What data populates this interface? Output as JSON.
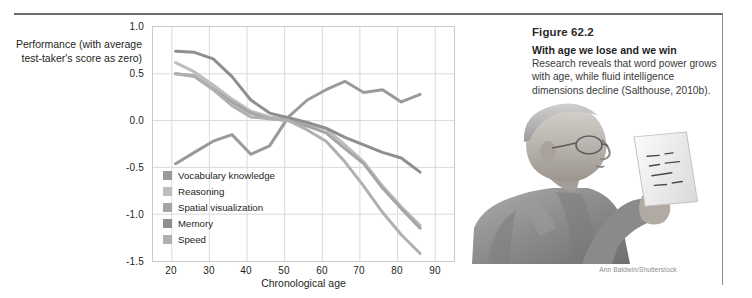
{
  "figure": {
    "caption_number": "Figure 62.2",
    "caption_lead": "With age we lose and we win",
    "caption_body": "Research reveals that word power grows with age, while fluid intelligence dimensions decline (Salthouse, 2010b).",
    "photo_credit": "Ann Baldwin/Shutterstock",
    "photo_alt": "older-man-reading-photo"
  },
  "chart_data": {
    "type": "line",
    "title": "",
    "xlabel": "Chronological age",
    "ylabel": "Performance (with average test-taker's score as zero)",
    "xlim": [
      15,
      95
    ],
    "ylim": [
      -1.5,
      1.0
    ],
    "xticks": [
      "20",
      "30",
      "40",
      "50",
      "60",
      "70",
      "80",
      "90"
    ],
    "xtick_values": [
      20,
      30,
      40,
      50,
      60,
      70,
      80,
      90
    ],
    "yticks": [
      "1.0",
      "0.5",
      "0.0",
      "-0.5",
      "-1.0",
      "-1.5"
    ],
    "ytick_values": [
      1.0,
      0.5,
      0.0,
      -0.5,
      -1.0,
      -1.5
    ],
    "grid": true,
    "legend_position": "inside-lower-left",
    "series": [
      {
        "name": "Vocabulary knowledge",
        "color": "#9a9a9a",
        "x": [
          21,
          26,
          31,
          36,
          41,
          46,
          51,
          56,
          61,
          66,
          71,
          76,
          81,
          86
        ],
        "y": [
          -0.46,
          -0.34,
          -0.22,
          -0.15,
          -0.36,
          -0.27,
          0.04,
          0.22,
          0.33,
          0.42,
          0.3,
          0.33,
          0.2,
          0.28
        ]
      },
      {
        "name": "Reasoning",
        "color": "#bdbdbd",
        "x": [
          21,
          26,
          31,
          36,
          41,
          46,
          51,
          56,
          61,
          66,
          71,
          76,
          81,
          86
        ],
        "y": [
          0.62,
          0.52,
          0.38,
          0.23,
          0.1,
          0.04,
          0.02,
          -0.04,
          -0.09,
          -0.26,
          -0.44,
          -0.7,
          -0.92,
          -1.12
        ]
      },
      {
        "name": "Spatial visualization",
        "color": "#a5a5a5",
        "x": [
          21,
          26,
          31,
          36,
          41,
          46,
          51,
          56,
          61,
          66,
          71,
          76,
          81,
          86
        ],
        "y": [
          0.5,
          0.48,
          0.34,
          0.2,
          0.08,
          0.02,
          0.0,
          -0.06,
          -0.13,
          -0.3,
          -0.46,
          -0.72,
          -0.94,
          -1.15
        ]
      },
      {
        "name": "Memory",
        "color": "#8f8f8f",
        "x": [
          21,
          26,
          31,
          36,
          41,
          46,
          51,
          56,
          61,
          66,
          71,
          76,
          81,
          86
        ],
        "y": [
          0.74,
          0.73,
          0.66,
          0.47,
          0.22,
          0.08,
          0.03,
          -0.02,
          -0.08,
          -0.18,
          -0.26,
          -0.34,
          -0.4,
          -0.55
        ]
      },
      {
        "name": "Speed",
        "color": "#b0b0b0",
        "x": [
          21,
          26,
          31,
          36,
          41,
          46,
          51,
          56,
          61,
          66,
          71,
          76,
          81,
          86
        ],
        "y": [
          0.5,
          0.47,
          0.33,
          0.16,
          0.04,
          0.02,
          0.0,
          -0.1,
          -0.22,
          -0.44,
          -0.7,
          -0.98,
          -1.22,
          -1.42
        ]
      }
    ]
  },
  "colors": {
    "rule": "#6d6d6d",
    "grid": "#d7d7d7",
    "axis_text": "#231f20",
    "caption_text": "#3a3a3a"
  }
}
